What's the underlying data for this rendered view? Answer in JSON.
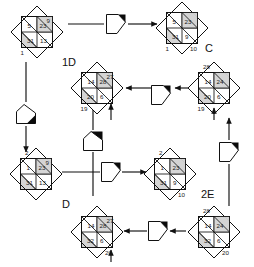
{
  "diagram": {
    "background": "#ffffff",
    "stroke_color": "#111111",
    "fill_light": "#ffffff",
    "fill_shaded": "#d4d4d4",
    "black": "#0a0a0a",
    "labels": [
      {
        "id": "label-1d",
        "text": "1D",
        "x": 62,
        "y": 66
      },
      {
        "id": "label-c",
        "text": "C",
        "x": 205,
        "y": 52
      },
      {
        "id": "label-d",
        "text": "D",
        "x": 62,
        "y": 208
      },
      {
        "id": "label-2e",
        "text": "2E",
        "x": 201,
        "y": 198
      }
    ],
    "nodes": [
      {
        "id": "node-top-left",
        "cx": 37,
        "cy": 32,
        "faces": [
          {
            "pos": "top-right",
            "value": "9"
          },
          {
            "pos": "upper-left",
            "value": "5"
          },
          {
            "pos": "upper-right",
            "value": "23"
          },
          {
            "pos": "lower-left",
            "value": "31"
          },
          {
            "pos": "lower-right",
            "value": "13"
          },
          {
            "pos": "bottom-left",
            "value": "1"
          }
        ]
      },
      {
        "id": "node-top-right",
        "cx": 182,
        "cy": 28,
        "faces": [
          {
            "pos": "upper-left",
            "value": "5"
          },
          {
            "pos": "upper-right",
            "value": "23"
          },
          {
            "pos": "lower-left",
            "value": "31"
          },
          {
            "pos": "lower-right",
            "value": "9"
          },
          {
            "pos": "bottom-left",
            "value": "1"
          },
          {
            "pos": "bottom-right",
            "value": "10"
          }
        ]
      },
      {
        "id": "node-mid-left",
        "cx": 97,
        "cy": 88,
        "faces": [
          {
            "pos": "top-right",
            "value": "27"
          },
          {
            "pos": "upper-left",
            "value": "14"
          },
          {
            "pos": "upper-right",
            "value": "28"
          },
          {
            "pos": "lower-left",
            "value": "20"
          },
          {
            "pos": "lower-right",
            "value": "6"
          },
          {
            "pos": "bottom-left",
            "value": "19"
          }
        ]
      },
      {
        "id": "node-mid-right",
        "cx": 214,
        "cy": 88,
        "faces": [
          {
            "pos": "top-left",
            "value": "28"
          },
          {
            "pos": "upper-left",
            "value": "14"
          },
          {
            "pos": "upper-right",
            "value": "24"
          },
          {
            "pos": "lower-left",
            "value": "20"
          },
          {
            "pos": "lower-right",
            "value": "6"
          },
          {
            "pos": "bottom-left",
            "value": "19"
          }
        ]
      },
      {
        "id": "node-bottom-left",
        "cx": 36,
        "cy": 174,
        "faces": [
          {
            "pos": "top-left",
            "value": "2"
          },
          {
            "pos": "top-right",
            "value": "9"
          },
          {
            "pos": "upper-left",
            "value": "1"
          },
          {
            "pos": "upper-right",
            "value": "23"
          },
          {
            "pos": "lower-left",
            "value": "31"
          },
          {
            "pos": "lower-right",
            "value": "13"
          }
        ]
      },
      {
        "id": "node-bottom-mid",
        "cx": 170,
        "cy": 174,
        "faces": [
          {
            "pos": "top-left",
            "value": "2"
          },
          {
            "pos": "upper-left",
            "value": "1"
          },
          {
            "pos": "upper-right",
            "value": "23"
          },
          {
            "pos": "lower-left",
            "value": "31"
          },
          {
            "pos": "lower-right",
            "value": "9"
          },
          {
            "pos": "bottom-right",
            "value": "10"
          }
        ]
      },
      {
        "id": "node-bottom-row-left",
        "cx": 97,
        "cy": 232,
        "faces": [
          {
            "pos": "top-right",
            "value": "27"
          },
          {
            "pos": "upper-left",
            "value": "14"
          },
          {
            "pos": "upper-right",
            "value": "28"
          },
          {
            "pos": "lower-left",
            "value": "32"
          },
          {
            "pos": "lower-right",
            "value": "6"
          },
          {
            "pos": "bottom-right",
            "value": "20"
          }
        ]
      },
      {
        "id": "node-bottom-row-right",
        "cx": 214,
        "cy": 232,
        "faces": [
          {
            "pos": "top-left",
            "value": "28"
          },
          {
            "pos": "upper-left",
            "value": "14"
          },
          {
            "pos": "upper-right",
            "value": "24"
          },
          {
            "pos": "lower-left",
            "value": "32"
          },
          {
            "pos": "lower-right",
            "value": "6"
          },
          {
            "pos": "bottom-right",
            "value": "20"
          }
        ]
      }
    ],
    "operators": [
      {
        "id": "op-top-center",
        "cx": 116,
        "cy": 24,
        "rot": 0,
        "black_corner": "upper-right"
      },
      {
        "id": "op-left-upper",
        "cx": 26,
        "cy": 114,
        "rot": -90,
        "black_corner": "lower-left"
      },
      {
        "id": "op-center-upper",
        "cx": 161,
        "cy": 95,
        "rot": 0,
        "black_corner": "upper-right"
      },
      {
        "id": "op-center-mid",
        "cx": 93,
        "cy": 141,
        "rot": -90,
        "black_corner": "lower-right"
      },
      {
        "id": "op-center-row",
        "cx": 111,
        "cy": 172,
        "rot": 0,
        "black_corner": "upper-right"
      },
      {
        "id": "op-right-lower",
        "cx": 229,
        "cy": 152,
        "rot": 0,
        "black_corner": "upper-right"
      },
      {
        "id": "op-bottom-left",
        "cx": 158,
        "cy": 231,
        "rot": 0,
        "black_corner": "upper-right"
      }
    ],
    "arrows": [
      {
        "id": "arrow-top-left-to-op",
        "from": [
          68,
          24
        ],
        "to": [
          104,
          24
        ],
        "head": false
      },
      {
        "id": "arrow-op-to-top-right",
        "from": [
          128,
          24
        ],
        "to": [
          157,
          24
        ],
        "head": true
      },
      {
        "id": "arrow-top-left-down",
        "from": [
          26,
          62
        ],
        "to": [
          26,
          102
        ],
        "head": false
      },
      {
        "id": "arrow-op-left-down",
        "from": [
          26,
          126
        ],
        "to": [
          26,
          152
        ],
        "head": true
      },
      {
        "id": "arrow-midleft-from-right",
        "from": [
          152,
          88
        ],
        "to": [
          126,
          88
        ],
        "head": true
      },
      {
        "id": "arrow-midright-in",
        "from": [
          188,
          88
        ],
        "to": [
          175,
          88
        ],
        "head": true
      },
      {
        "id": "arrow-midleft-up",
        "from": [
          111,
          120
        ],
        "to": [
          111,
          104
        ],
        "head": true
      },
      {
        "id": "arrow-center-vertical",
        "from": [
          93,
          110
        ],
        "to": [
          93,
          130
        ],
        "head": false
      },
      {
        "id": "arrow-center-down",
        "from": [
          93,
          152
        ],
        "to": [
          93,
          196
        ],
        "head": false
      },
      {
        "id": "arrow-row-left-to-op",
        "from": [
          62,
          172
        ],
        "to": [
          100,
          172
        ],
        "head": false
      },
      {
        "id": "arrow-op-to-bottom-mid",
        "from": [
          122,
          172
        ],
        "to": [
          146,
          172
        ],
        "head": true
      },
      {
        "id": "arrow-right-op-up",
        "from": [
          229,
          140
        ],
        "to": [
          229,
          118
        ],
        "head": true
      },
      {
        "id": "arrow-right-op-down",
        "from": [
          229,
          164
        ],
        "to": [
          229,
          206
        ],
        "head": false
      },
      {
        "id": "arrow-bottomrow-in",
        "from": [
          186,
          231
        ],
        "to": [
          170,
          231
        ],
        "head": true
      },
      {
        "id": "arrow-bottomrow-to-left",
        "from": [
          147,
          231
        ],
        "to": [
          124,
          231
        ],
        "head": true
      },
      {
        "id": "arrow-bottomleftcube-up",
        "from": [
          111,
          262
        ],
        "to": [
          111,
          250
        ],
        "head": true
      },
      {
        "id": "arrow-midleft-bottom-up",
        "from": [
          214,
          120
        ],
        "to": [
          214,
          108
        ],
        "head": true
      }
    ]
  }
}
